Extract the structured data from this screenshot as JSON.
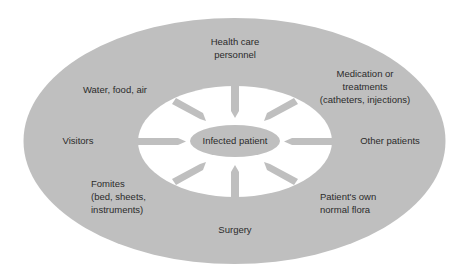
{
  "diagram": {
    "colors": {
      "outer_ring": "#bfbfbf",
      "inner_area": "#ffffff",
      "center": "#bfbfbf",
      "arrow": "#bfbfbf",
      "text": "#2b2b2b"
    },
    "center": {
      "label": "Infected patient"
    },
    "sources": [
      {
        "id": "health-care-personnel",
        "lines": [
          "Health care",
          "personnel"
        ]
      },
      {
        "id": "medication-treatments",
        "lines": [
          "Medication or",
          "treatments",
          "(catheters,  injections)"
        ]
      },
      {
        "id": "other-patients",
        "lines": [
          "Other patients"
        ]
      },
      {
        "id": "patients-own-flora",
        "lines": [
          "Patient's own",
          "normal flora"
        ]
      },
      {
        "id": "surgery",
        "lines": [
          "Surgery"
        ]
      },
      {
        "id": "fomites",
        "lines": [
          "Fomites",
          "(bed, sheets,",
          "instruments)"
        ]
      },
      {
        "id": "visitors",
        "lines": [
          "Visitors"
        ]
      },
      {
        "id": "water-food-air",
        "lines": [
          "Water, food, air"
        ]
      }
    ]
  }
}
